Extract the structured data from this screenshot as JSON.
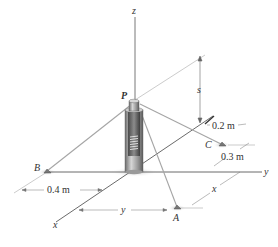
{
  "figure": {
    "axes": {
      "z": "z",
      "y": "y",
      "x": "x"
    },
    "points": {
      "P": "P",
      "A": "A",
      "B": "B",
      "C": "C"
    },
    "dimensions": {
      "s": "s",
      "d_02": "0.2 m",
      "d_03": "0.3 m",
      "d_04": "0.4 m",
      "y_dim": "y",
      "x_dim": "x"
    },
    "colors": {
      "axis": "#333333",
      "cable": "#9a9a9a",
      "dimension": "#777777",
      "shadow": "#c8c8c8",
      "cylinder": "#8a8a8a"
    }
  }
}
